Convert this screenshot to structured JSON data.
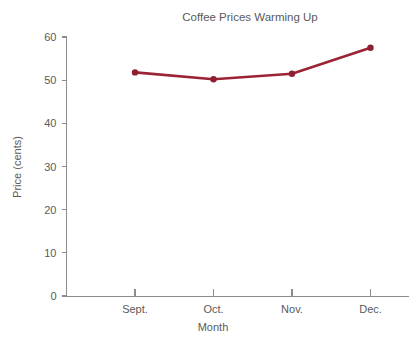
{
  "chart_data": {
    "type": "line",
    "title": "Coffee Prices Warming Up",
    "xlabel": "Month",
    "ylabel": "Price (cents)",
    "categories": [
      "Sept.",
      "Oct.",
      "Nov.",
      "Dec."
    ],
    "values": [
      51.8,
      50.2,
      51.5,
      57.5
    ],
    "series": [
      {
        "name": "Coffee price",
        "values": [
          51.8,
          50.2,
          51.5,
          57.5
        ]
      }
    ],
    "ylim": [
      0,
      60
    ],
    "ytick_labels": [
      "0",
      "10",
      "20",
      "30",
      "40",
      "50",
      "60"
    ],
    "ytick_values": [
      0,
      10,
      20,
      30,
      40,
      50,
      60
    ],
    "xtick_labels": [
      "Sept.",
      "Oct.",
      "Nov.",
      "Dec."
    ],
    "grid": false,
    "legend": "none",
    "colors": {
      "line": "#9B2335",
      "marker": "#8E1F30",
      "axis": "#8C8C8C",
      "text": "#5A5A5A",
      "background": "#FFFFFF"
    }
  }
}
